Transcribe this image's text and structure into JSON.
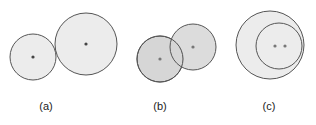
{
  "colors": {
    "stroke": "#555555",
    "fill_light": "#ececec",
    "fill_mid": "#d6d6d6",
    "dot": "#444444"
  },
  "panels": [
    {
      "label": "(a)",
      "description": "two externally tangent circles",
      "circles": [
        {
          "cx": 33,
          "cy": 57,
          "r": 23
        },
        {
          "cx": 86,
          "cy": 44,
          "r": 31
        }
      ],
      "dots": [
        {
          "x": 33,
          "y": 57
        },
        {
          "x": 86,
          "y": 44
        }
      ],
      "label_pos": {
        "x": 46,
        "y": 100
      }
    },
    {
      "label": "(b)",
      "description": "two intersecting circles",
      "circles": [
        {
          "cx": 160,
          "cy": 59,
          "r": 23
        },
        {
          "cx": 193,
          "cy": 47,
          "r": 23
        }
      ],
      "dots": [
        {
          "x": 160,
          "y": 59
        },
        {
          "x": 193,
          "y": 47
        }
      ],
      "label_pos": {
        "x": 160,
        "y": 100
      }
    },
    {
      "label": "(c)",
      "description": "one circle contained within another",
      "circles": [
        {
          "cx": 270,
          "cy": 45,
          "r": 34
        },
        {
          "cx": 279,
          "cy": 46,
          "r": 23
        }
      ],
      "dots": [
        {
          "x": 275,
          "y": 46
        },
        {
          "x": 285,
          "y": 46
        }
      ],
      "label_pos": {
        "x": 269,
        "y": 100
      }
    }
  ]
}
